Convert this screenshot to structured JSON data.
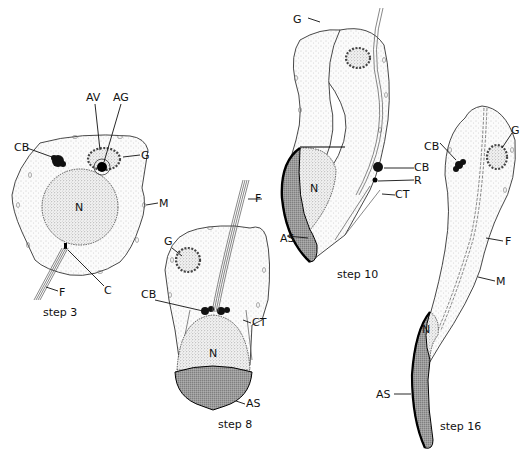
{
  "figure": {
    "panels": [
      {
        "id": "step3",
        "caption": "step 3",
        "labels": {
          "CB": "CB",
          "AV": "AV",
          "AG": "AG",
          "G": "G",
          "M": "M",
          "N": "N",
          "C": "C",
          "F": "F"
        }
      },
      {
        "id": "step8",
        "caption": "step 8",
        "labels": {
          "F": "F",
          "G": "G",
          "CB": "CB",
          "CT": "CT",
          "N": "N",
          "AS": "AS"
        }
      },
      {
        "id": "step10",
        "caption": "step 10",
        "labels": {
          "G": "G",
          "CB": "CB",
          "R": "R",
          "CT": "CT",
          "N": "N",
          "AS": "AS"
        }
      },
      {
        "id": "step16",
        "caption": "step 16",
        "labels": {
          "CB": "CB",
          "G": "G",
          "F": "F",
          "M": "M",
          "N": "N",
          "AS": "AS"
        }
      }
    ],
    "legend_abbreviations": [
      "CB",
      "AV",
      "AG",
      "G",
      "M",
      "N",
      "C",
      "F",
      "CT",
      "AS",
      "R"
    ]
  }
}
